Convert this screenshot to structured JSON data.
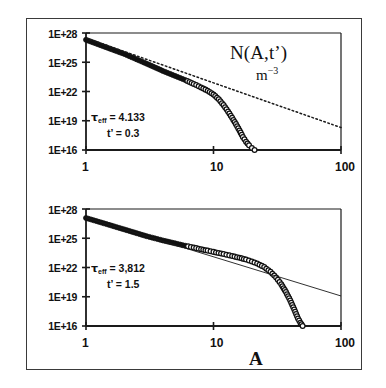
{
  "figure": {
    "quantity_label": "N(A,t’)",
    "units_base": "m",
    "units_exponent": "−3",
    "x_axis_name": "A"
  },
  "panels": [
    {
      "id": "top",
      "y_tick_labels": [
        "1E+28",
        "1E+25",
        "1E+22",
        "1E+19",
        "1E+16"
      ],
      "x_tick_labels": [
        "1",
        "10",
        "100"
      ],
      "annotation": {
        "tau_symbol": "τ",
        "tau_subscript": "eff",
        "tau_equals": " = 4.133",
        "time_line": "t’ = 1.5",
        "time_label": "t’",
        "time_value": "0.3"
      }
    },
    {
      "id": "bottom",
      "y_tick_labels": [
        "1E+28",
        "1E+25",
        "1E+22",
        "1E+19",
        "1E+16"
      ],
      "x_tick_labels": [
        "1",
        "10",
        "100"
      ],
      "annotation": {
        "tau_symbol": "τ",
        "tau_subscript": "eff",
        "tau_equals": " = 3,812",
        "time_label": "t’",
        "time_value": "1.5"
      }
    }
  ],
  "chart_data": {
    "type": "scatter",
    "title": "",
    "xlabel": "A",
    "ylabel": "N(A,t') m^-3",
    "xscale": "log",
    "yscale": "log",
    "xlim": [
      1,
      100
    ],
    "ylim": [
      1e+16,
      1e+28
    ],
    "x_ticks": [
      1,
      10,
      100
    ],
    "y_ticks": [
      1e+28,
      1e+25,
      1e+22,
      1e+19,
      1e+16
    ],
    "grid": false,
    "legend": null,
    "panels": [
      {
        "name": "upper panel",
        "annotations": [
          "τ_eff = 4.133",
          "t' = 0.3"
        ],
        "tau_eff": 4.133,
        "t_prime": 0.3,
        "series": [
          {
            "name": "N(A,t') data points",
            "marker": "circle",
            "marker_fill": "filled for A<=6, open for A>6",
            "x": [
              1,
              2,
              3,
              4,
              5,
              6,
              7,
              8,
              9,
              10,
              11,
              12,
              13,
              14,
              15,
              16,
              17,
              18,
              19,
              20,
              21
            ],
            "y": [
              2e+27,
              7e+25,
              7e+24,
              1.3e+24,
              4e+23,
              1.5e+23,
              6e+22,
              2.6e+22,
              1.2e+22,
              5e+21,
              1.6e+21,
              4e+20,
              9e+19,
              2e+19,
              4.5e+18,
              1e+18,
              2.2e+17,
              7e+16,
              3e+16,
              1.6e+16,
              1e+16
            ]
          },
          {
            "name": "power-law reference line (dotted)",
            "style": "dotted",
            "x": [
              1,
              100
            ],
            "y": [
              3e+27,
              2e+18
            ]
          }
        ]
      },
      {
        "name": "lower panel",
        "annotations": [
          "τ_eff = 3,812",
          "t' = 1.5"
        ],
        "tau_eff": 3.812,
        "t_prime": 1.5,
        "series": [
          {
            "name": "N(A,t') data points",
            "marker": "circle",
            "marker_fill": "filled for A<=6, open for A>6",
            "x": [
              1,
              2,
              3,
              4,
              5,
              6,
              7,
              8,
              9,
              10,
              12,
              14,
              16,
              18,
              20,
              22,
              25,
              28,
              31,
              34,
              37,
              40,
              43,
              46,
              48,
              50
            ],
            "y": [
              1.2e+27,
              8e+25,
              1.6e+25,
              6e+24,
              3e+24,
              1.7e+24,
              1.1e+24,
              7.5e+23,
              5.4e+23,
              4e+23,
              2.4e+23,
              1.5e+23,
              1e+23,
              6.5e+22,
              4.2e+22,
              2.6e+22,
              1.1e+22,
              3.6e+21,
              9.5e+20,
              1.9e+20,
              3e+19,
              4.2e+18,
              5e+17,
              6e+16,
              2.2e+16,
              1e+16
            ]
          },
          {
            "name": "power-law reference line (solid thin)",
            "style": "solid",
            "x": [
              1,
              100
            ],
            "y": [
              1.3e+27,
              1.2e+19
            ]
          }
        ]
      }
    ]
  }
}
